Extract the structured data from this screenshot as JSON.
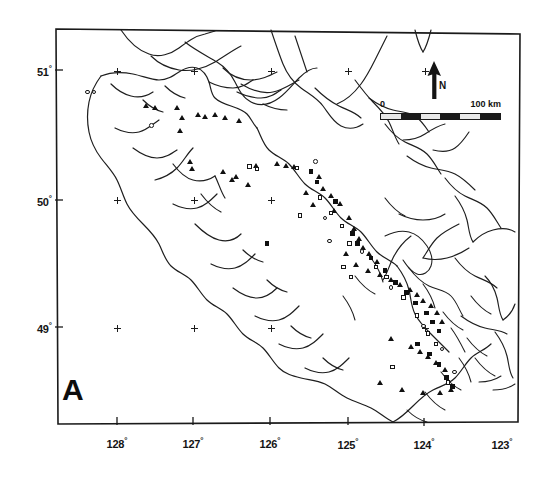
{
  "figure": {
    "panel_label": "A",
    "background_color": "#ffffff",
    "ink_color": "#101010",
    "width": 553,
    "height": 482
  },
  "axes": {
    "degree_symbol": "°",
    "latitude": {
      "label_unit": "°",
      "ticks": [
        {
          "value": 51,
          "text": "51",
          "y": 70
        },
        {
          "value": 50,
          "text": "50",
          "y": 200
        },
        {
          "value": 49,
          "text": "49",
          "y": 327
        }
      ]
    },
    "longitude": {
      "label_unit": "°",
      "ticks": [
        {
          "value": 128,
          "text": "128",
          "x": 117
        },
        {
          "value": 127,
          "text": "127",
          "x": 193
        },
        {
          "value": 126,
          "text": "126",
          "x": 270
        },
        {
          "value": 125,
          "text": "125",
          "x": 348
        },
        {
          "value": 124,
          "text": "124",
          "x": 424
        },
        {
          "value": 123,
          "text": "123",
          "x": 502
        }
      ]
    }
  },
  "north_arrow": {
    "label": "N",
    "direction": "up"
  },
  "scale_bar": {
    "min_label": "0",
    "max_label": "100 km",
    "unit": "km",
    "length_value": 100,
    "segments": 6
  },
  "legend_symbols": [
    {
      "name": "filled-triangle",
      "meaning": "record-triangle"
    },
    {
      "name": "filled-square",
      "meaning": "record-square"
    },
    {
      "name": "open-square",
      "meaning": "record-open-square"
    },
    {
      "name": "open-circle",
      "meaning": "record-open-circle"
    },
    {
      "name": "grid-cross",
      "meaning": "graticule-intersection"
    }
  ],
  "chart_data": {
    "type": "scatter",
    "title": "A",
    "xlabel": "Longitude (°W)",
    "ylabel": "Latitude (°N)",
    "xlim": [
      128.5,
      122.95
    ],
    "ylim": [
      48.3,
      51.25
    ],
    "grid": true,
    "legend": "none",
    "series": [
      {
        "name": "grid-cross",
        "symbol": "cross",
        "points": [
          [
            128.0,
            51.0
          ],
          [
            127.0,
            51.0
          ],
          [
            126.0,
            51.0
          ],
          [
            125.0,
            51.0
          ],
          [
            124.0,
            51.0
          ],
          [
            128.0,
            50.0
          ],
          [
            127.0,
            50.0
          ],
          [
            126.0,
            50.0
          ],
          [
            128.0,
            49.0
          ],
          [
            127.0,
            49.0
          ],
          [
            126.0,
            49.0
          ],
          [
            124.0,
            49.0
          ]
        ]
      },
      {
        "name": "record-triangle",
        "symbol": "filled-triangle",
        "points": [
          [
            127.62,
            50.73
          ],
          [
            127.5,
            50.72
          ],
          [
            127.22,
            50.72
          ],
          [
            127.16,
            50.64
          ],
          [
            127.18,
            50.54
          ],
          [
            126.95,
            50.66
          ],
          [
            126.86,
            50.65
          ],
          [
            126.72,
            50.66
          ],
          [
            126.6,
            50.64
          ],
          [
            126.42,
            50.62
          ],
          [
            127.05,
            50.3
          ],
          [
            127.02,
            50.24
          ],
          [
            126.62,
            50.22
          ],
          [
            126.45,
            50.18
          ],
          [
            126.5,
            50.16
          ],
          [
            126.2,
            50.27
          ],
          [
            125.92,
            50.28
          ],
          [
            125.8,
            50.27
          ],
          [
            125.7,
            50.26
          ],
          [
            125.38,
            50.18
          ],
          [
            125.32,
            50.09
          ],
          [
            125.22,
            50.03
          ],
          [
            125.1,
            49.97
          ],
          [
            125.18,
            49.92
          ],
          [
            124.98,
            49.86
          ],
          [
            124.92,
            49.78
          ],
          [
            124.86,
            49.7
          ],
          [
            124.8,
            49.63
          ],
          [
            124.72,
            49.58
          ],
          [
            124.62,
            49.52
          ],
          [
            124.74,
            49.45
          ],
          [
            124.58,
            49.42
          ],
          [
            124.44,
            49.38
          ],
          [
            124.32,
            49.34
          ],
          [
            124.2,
            49.3
          ],
          [
            124.1,
            49.26
          ],
          [
            124.02,
            49.22
          ],
          [
            123.92,
            49.18
          ],
          [
            123.84,
            49.12
          ],
          [
            123.78,
            49.05
          ],
          [
            124.44,
            48.92
          ],
          [
            124.18,
            48.86
          ],
          [
            124.06,
            48.82
          ],
          [
            123.96,
            48.78
          ],
          [
            123.86,
            48.73
          ],
          [
            123.74,
            48.68
          ],
          [
            124.58,
            48.58
          ],
          [
            124.3,
            48.52
          ],
          [
            124.02,
            48.5
          ],
          [
            123.8,
            48.5
          ],
          [
            123.66,
            48.52
          ],
          [
            126.3,
            50.12
          ],
          [
            125.55,
            50.06
          ],
          [
            125.45,
            49.96
          ],
          [
            125.02,
            49.58
          ],
          [
            124.9,
            49.5
          ]
        ]
      },
      {
        "name": "record-square",
        "symbol": "filled-square",
        "points": [
          [
            126.05,
            49.66
          ],
          [
            125.48,
            50.22
          ],
          [
            125.4,
            50.14
          ],
          [
            125.16,
            49.99
          ],
          [
            124.94,
            49.74
          ],
          [
            124.88,
            49.66
          ],
          [
            124.7,
            49.55
          ],
          [
            124.52,
            49.45
          ],
          [
            124.38,
            49.36
          ],
          [
            124.24,
            49.28
          ],
          [
            124.12,
            49.2
          ],
          [
            123.98,
            49.12
          ],
          [
            123.9,
            49.05
          ],
          [
            123.82,
            48.98
          ],
          [
            124.1,
            48.88
          ],
          [
            123.94,
            48.8
          ],
          [
            123.82,
            48.72
          ],
          [
            123.72,
            48.62
          ],
          [
            123.64,
            48.55
          ]
        ]
      },
      {
        "name": "record-open-square",
        "symbol": "open-square",
        "points": [
          [
            126.28,
            50.26
          ],
          [
            126.18,
            50.24
          ],
          [
            125.66,
            50.25
          ],
          [
            125.36,
            50.02
          ],
          [
            125.22,
            49.9
          ],
          [
            125.08,
            49.8
          ],
          [
            124.98,
            49.66
          ],
          [
            125.06,
            49.48
          ],
          [
            124.96,
            49.4
          ],
          [
            124.64,
            49.48
          ],
          [
            124.5,
            49.4
          ],
          [
            124.28,
            49.24
          ],
          [
            124.1,
            49.1
          ],
          [
            123.96,
            48.96
          ],
          [
            123.86,
            48.88
          ],
          [
            124.42,
            48.7
          ],
          [
            123.7,
            48.58
          ],
          [
            125.62,
            49.88
          ]
        ]
      },
      {
        "name": "record-open-circle",
        "symbol": "open-circle",
        "points": [
          [
            128.38,
            50.84
          ],
          [
            128.3,
            50.84
          ],
          [
            127.55,
            50.58
          ],
          [
            125.42,
            50.3
          ],
          [
            125.3,
            49.86
          ],
          [
            125.24,
            49.68
          ],
          [
            124.82,
            49.6
          ],
          [
            124.44,
            49.32
          ],
          [
            124.02,
            49.02
          ],
          [
            123.78,
            48.84
          ],
          [
            123.62,
            48.66
          ]
        ]
      }
    ]
  }
}
